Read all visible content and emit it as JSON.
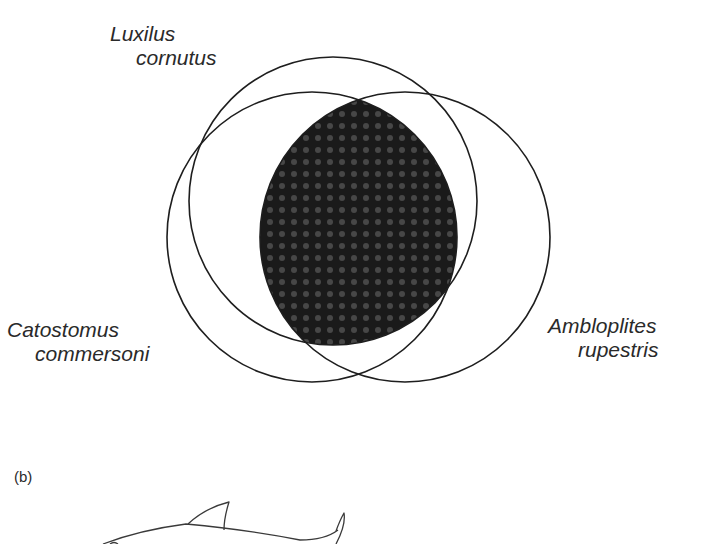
{
  "diagram": {
    "type": "venn",
    "sets": [
      {
        "name": "Luxilus cornutus",
        "line1": "Luxilus",
        "line2": "cornutus"
      },
      {
        "name": "Catostomus commersoni",
        "line1": "Catostomus",
        "line2": "commersoni"
      },
      {
        "name": "Ambloplites rupestris",
        "line1": "Ambloplites",
        "line2": "rupestris"
      }
    ],
    "shaded_region": "intersection of all three sets",
    "colors": {
      "stroke": "#1e1e1e",
      "shade": "#1a1a1a",
      "shade_dot": "#555555",
      "text": "#2a2a2a"
    }
  },
  "panel_b": {
    "label": "(b)",
    "figure": "fish outline (partial)"
  }
}
